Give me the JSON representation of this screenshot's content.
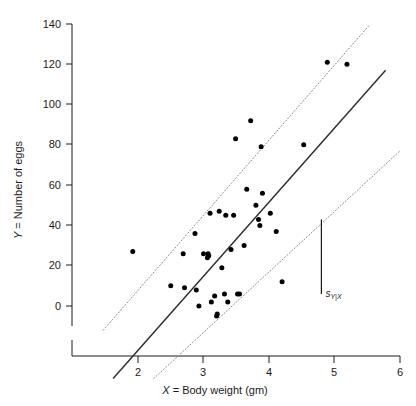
{
  "chart_data": {
    "type": "scatter",
    "title": "",
    "xlabel": "X = Body weight (gm)",
    "ylabel": "Y = Number of eggs",
    "xlim": [
      1.45,
      6.0
    ],
    "ylim": [
      -40,
      140
    ],
    "xticks": [
      2,
      3,
      4,
      5,
      6
    ],
    "xtick_labels": [
      "2",
      "3",
      "4",
      "5",
      "6"
    ],
    "yticks": [
      0,
      20,
      40,
      60,
      80,
      100,
      120,
      140
    ],
    "ytick_labels": [
      "0",
      "20",
      "40",
      "60",
      "80",
      "100",
      "120",
      "140"
    ],
    "grid": false,
    "legend": null,
    "axis_break": true,
    "points": [
      {
        "x": 1.92,
        "y": 27
      },
      {
        "x": 2.5,
        "y": 10
      },
      {
        "x": 2.69,
        "y": 26
      },
      {
        "x": 2.71,
        "y": 9
      },
      {
        "x": 2.87,
        "y": 36
      },
      {
        "x": 2.89,
        "y": 8
      },
      {
        "x": 2.93,
        "y": 0
      },
      {
        "x": 3.0,
        "y": 26
      },
      {
        "x": 3.06,
        "y": 24
      },
      {
        "x": 3.07,
        "y": 26
      },
      {
        "x": 3.08,
        "y": 25
      },
      {
        "x": 3.1,
        "y": 46
      },
      {
        "x": 3.12,
        "y": 2
      },
      {
        "x": 3.17,
        "y": 5
      },
      {
        "x": 3.2,
        "y": -5
      },
      {
        "x": 3.21,
        "y": -4
      },
      {
        "x": 3.24,
        "y": 47
      },
      {
        "x": 3.28,
        "y": 19
      },
      {
        "x": 3.32,
        "y": 6
      },
      {
        "x": 3.34,
        "y": 45
      },
      {
        "x": 3.37,
        "y": 2
      },
      {
        "x": 3.42,
        "y": 28
      },
      {
        "x": 3.46,
        "y": 45
      },
      {
        "x": 3.49,
        "y": 83
      },
      {
        "x": 3.52,
        "y": 6
      },
      {
        "x": 3.55,
        "y": 6
      },
      {
        "x": 3.62,
        "y": 30
      },
      {
        "x": 3.66,
        "y": 58
      },
      {
        "x": 3.72,
        "y": 92
      },
      {
        "x": 3.8,
        "y": 50
      },
      {
        "x": 3.84,
        "y": 43
      },
      {
        "x": 3.86,
        "y": 40
      },
      {
        "x": 3.88,
        "y": 79
      },
      {
        "x": 3.9,
        "y": 56
      },
      {
        "x": 4.02,
        "y": 46
      },
      {
        "x": 4.11,
        "y": 37
      },
      {
        "x": 4.2,
        "y": 12
      },
      {
        "x": 4.53,
        "y": 80
      },
      {
        "x": 4.89,
        "y": 121
      },
      {
        "x": 5.19,
        "y": 120
      }
    ],
    "regression_line": {
      "style": "solid",
      "x_start": 1.62,
      "y_start": -36,
      "x_end": 5.78,
      "y_end": 117
    },
    "band_lines": [
      {
        "name": "upper-band",
        "style": "dotted",
        "x_start": 1.47,
        "y_start": -12,
        "x_end": 5.52,
        "y_end": 139
      },
      {
        "name": "lower-band",
        "style": "dotted",
        "x_start": 2.24,
        "y_start": -36,
        "x_end": 6.0,
        "y_end": 77
      }
    ],
    "error_bar": {
      "label": "s",
      "subscript": "Y|X",
      "x": 4.8,
      "y_low": 6,
      "y_high": 43
    },
    "annotations": []
  },
  "figure": {
    "background_color": "#ffffff",
    "axis_color": "#1a1a1a",
    "point_color": "#000000",
    "line_color": "#2a2a2a",
    "band_color": "#8a8a8a"
  }
}
